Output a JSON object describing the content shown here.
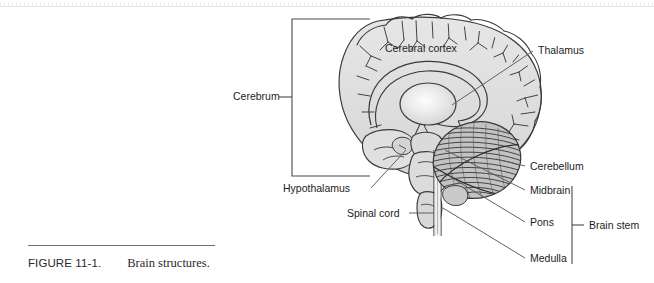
{
  "figure": {
    "caption_label": "FIGURE 11-1.",
    "caption_text": "Brain structures.",
    "title": "Brain structures",
    "type": "anatomical-diagram",
    "view": "midsagittal section of the human brain"
  },
  "labels": {
    "cerebral_cortex": "Cerebral cortex",
    "thalamus": "Thalamus",
    "cerebrum": "Cerebrum",
    "cerebellum": "Cerebellum",
    "hypothalamus": "Hypothalamus",
    "spinal_cord": "Spinal cord",
    "midbrain": "Midbrain",
    "pons": "Pons",
    "medulla": "Medulla",
    "brain_stem": "Brain stem"
  },
  "colors": {
    "page_background": "#ffffff",
    "line": "#3a3a3a",
    "brain_fill": "#dcdcdc",
    "brain_fill_light": "#ececec",
    "cerebellum_fill": "#b9b9b9",
    "text": "#1d1d1d",
    "rule": "#6f6f72",
    "scan_edge": "#e2e2e4"
  }
}
